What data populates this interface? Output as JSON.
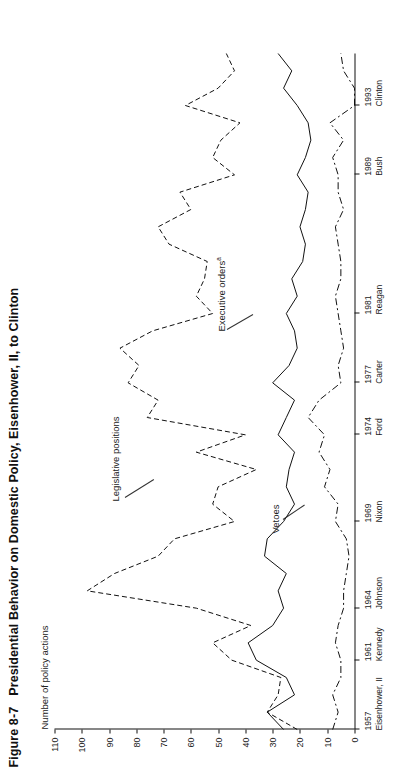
{
  "figure": {
    "number": "Figure 8-7",
    "caption": "Presidential Behavior on Domestic Policy, Eisenhower, II, to Clinton",
    "axis_label_y": "Number of policy actions"
  },
  "annotations": {
    "legislative_positions": "Legislative positions",
    "executive_orders": "Executive orders",
    "executive_orders_note": "a",
    "vetoes": "Vetoes"
  },
  "axes": {
    "y_ticks": [
      "110",
      "100",
      "90",
      "80",
      "70",
      "60",
      "50",
      "40",
      "30",
      "20",
      "10",
      "0"
    ],
    "y_min": 0,
    "y_max": 110,
    "x_ticks": [
      {
        "year": "1957",
        "name": "Eisenhower, II"
      },
      {
        "year": "1961",
        "name": "Kennedy"
      },
      {
        "year": "1964",
        "name": "Johnson"
      },
      {
        "year": "1969",
        "name": "Nixon"
      },
      {
        "year": "1974",
        "name": "Ford"
      },
      {
        "year": "1977",
        "name": "Carter"
      },
      {
        "year": "1981",
        "name": "Reagan"
      },
      {
        "year": "1989",
        "name": "Bush"
      },
      {
        "year": "1993",
        "name": "Clinton"
      }
    ]
  },
  "chart_data": {
    "type": "line",
    "title": "Presidential Behavior on Domestic Policy, Eisenhower, II, to Clinton",
    "xlabel": "",
    "ylabel": "Number of policy actions",
    "ylim": [
      0,
      110
    ],
    "xlim": [
      1957,
      1996
    ],
    "grid": false,
    "legend": "inline annotations",
    "x": [
      1957,
      1958,
      1959,
      1960,
      1961,
      1962,
      1963,
      1964,
      1965,
      1966,
      1967,
      1968,
      1969,
      1970,
      1971,
      1972,
      1973,
      1974,
      1975,
      1976,
      1977,
      1978,
      1979,
      1980,
      1981,
      1982,
      1983,
      1984,
      1985,
      1986,
      1987,
      1988,
      1989,
      1990,
      1991,
      1992,
      1993,
      1994,
      1995,
      1996
    ],
    "series": [
      {
        "name": "Legislative positions",
        "style": "dashed",
        "values": [
          21,
          32,
          28,
          27,
          45,
          52,
          38,
          58,
          98,
          88,
          72,
          66,
          44,
          52,
          50,
          36,
          58,
          40,
          76,
          72,
          83,
          79,
          86,
          74,
          52,
          58,
          55,
          54,
          68,
          72,
          60,
          64,
          44,
          52,
          49,
          42,
          62,
          50,
          44,
          47
        ]
      },
      {
        "name": "Executive orders",
        "style": "solid",
        "values": [
          26,
          32,
          22,
          25,
          36,
          39,
          30,
          26,
          28,
          25,
          33,
          32,
          26,
          22,
          25,
          24,
          22,
          28,
          25,
          22,
          30,
          24,
          21,
          22,
          25,
          21,
          23,
          19,
          18,
          20,
          18,
          17,
          21,
          18,
          16,
          17,
          21,
          26,
          23,
          28
        ]
      },
      {
        "name": "Vetoes",
        "style": "dashdot",
        "values": [
          8,
          6,
          8,
          5,
          5,
          7,
          6,
          4,
          4,
          3,
          2,
          3,
          7,
          6,
          11,
          9,
          13,
          11,
          17,
          13,
          5,
          6,
          4,
          5,
          6,
          7,
          5,
          5,
          6,
          7,
          4,
          6,
          6,
          8,
          4,
          9,
          0,
          0,
          4,
          5
        ]
      }
    ]
  }
}
